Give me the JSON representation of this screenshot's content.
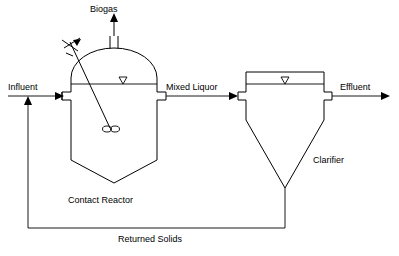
{
  "diagram": {
    "colors": {
      "line": "#000000",
      "background": "#ffffff",
      "text": "#000000"
    },
    "labels": {
      "biogas": "Biogas",
      "influent": "Influent",
      "mixed_liquor": "Mixed Liquor",
      "effluent": "Effluent",
      "contact_reactor": "Contact Reactor",
      "clarifier": "Clarifier",
      "returned_solids": "Returned Solids"
    },
    "icons": {
      "water_level": "water-level-triangle-icon",
      "mixer": "mixer-impeller-icon",
      "motor": "mixer-motor-icon",
      "flow_arrow": "flow-arrow-icon"
    },
    "units": [
      {
        "name": "Contact Reactor",
        "type": "domed-tank-with-mixer",
        "inlet": "Influent",
        "outlet": "Mixed Liquor",
        "gas_outlet": "Biogas"
      },
      {
        "name": "Clarifier",
        "type": "rectangular-tank-with-conical-bottom",
        "inlet": "Mixed Liquor",
        "overflow": "Effluent",
        "underflow": "Returned Solids"
      }
    ],
    "streams": [
      {
        "label": "Influent",
        "direction": "right"
      },
      {
        "label": "Biogas",
        "direction": "up"
      },
      {
        "label": "Mixed Liquor",
        "direction": "right"
      },
      {
        "label": "Effluent",
        "direction": "right"
      },
      {
        "label": "Returned Solids",
        "direction": "left-then-up"
      }
    ]
  }
}
